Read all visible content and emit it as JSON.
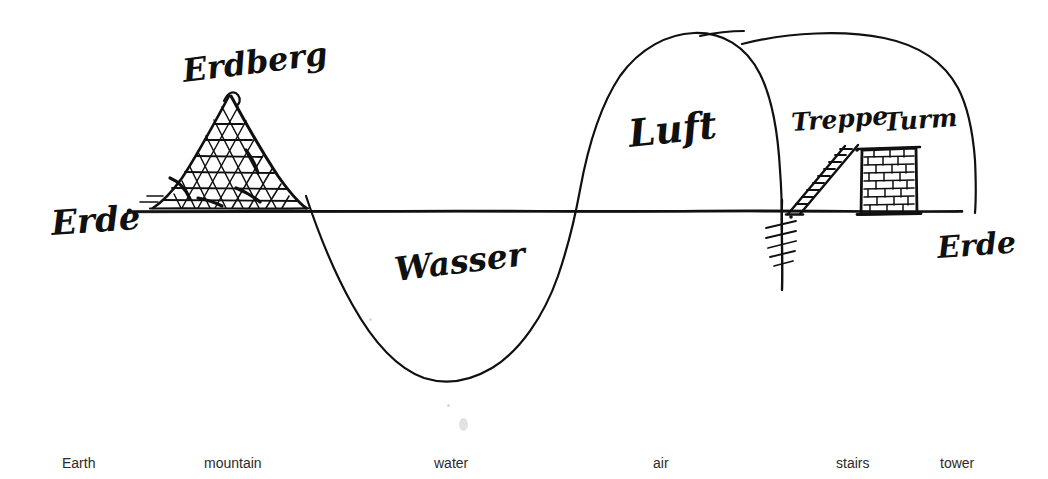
{
  "diagram": {
    "ink_color": "#101010",
    "paper_color": "#ffffff",
    "labels": {
      "erde_left": "Erde",
      "erde_right": "Erde",
      "erdberg": "Erdberg",
      "wasser": "Wasser",
      "luft": "Luft",
      "treppe": "Treppe",
      "turm": "Turm"
    },
    "ground_line": {
      "y": 211,
      "x_start": 128,
      "x_end": 962
    },
    "wave": {
      "zero_crossings": [
        310,
        575
      ],
      "trough_depth_y": 380,
      "trough_x": 450
    },
    "mountain": {
      "apex_x": 228,
      "apex_y": 95,
      "base_left_x": 152,
      "base_right_x": 305,
      "base_y": 208,
      "hatch": "cross-hatched"
    },
    "tower": {
      "left_x": 862,
      "right_x": 916,
      "top_y": 148,
      "bottom_y": 214,
      "fill": "brick"
    },
    "stairs": {
      "bottom_x": 790,
      "bottom_y": 214,
      "top_x": 846,
      "top_y": 144,
      "steps": 9
    },
    "pillar": {
      "x": 782,
      "top_y": 205,
      "bottom_y": 290,
      "hatch_marks": 5
    }
  },
  "captions": [
    {
      "text": "Earth",
      "x": 62,
      "name": "caption-earth"
    },
    {
      "text": "mountain",
      "x": 204,
      "name": "caption-mountain"
    },
    {
      "text": "water",
      "x": 434,
      "name": "caption-water"
    },
    {
      "text": "air",
      "x": 653,
      "name": "caption-air"
    },
    {
      "text": "stairs",
      "x": 836,
      "name": "caption-stairs"
    },
    {
      "text": "tower",
      "x": 940,
      "name": "caption-tower"
    }
  ]
}
